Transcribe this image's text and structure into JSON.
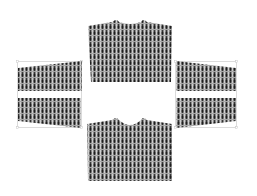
{
  "canvas": {
    "width": 257,
    "height": 196,
    "background": "#ffffff"
  },
  "colors": {
    "fabric_base": "#8a8a8a",
    "fabric_dark": "#1e1e1e",
    "fabric_light": "#d0d0d0",
    "bbox_stroke": "#c4c4c4"
  },
  "pieces": [
    {
      "id": "back-body",
      "label": ""
    },
    {
      "id": "front-body",
      "label": ""
    },
    {
      "id": "left-sleeve-upper",
      "label": ""
    },
    {
      "id": "left-sleeve-lower",
      "label": ""
    },
    {
      "id": "right-sleeve-upper",
      "label": ""
    },
    {
      "id": "right-sleeve-lower",
      "label": ""
    }
  ]
}
